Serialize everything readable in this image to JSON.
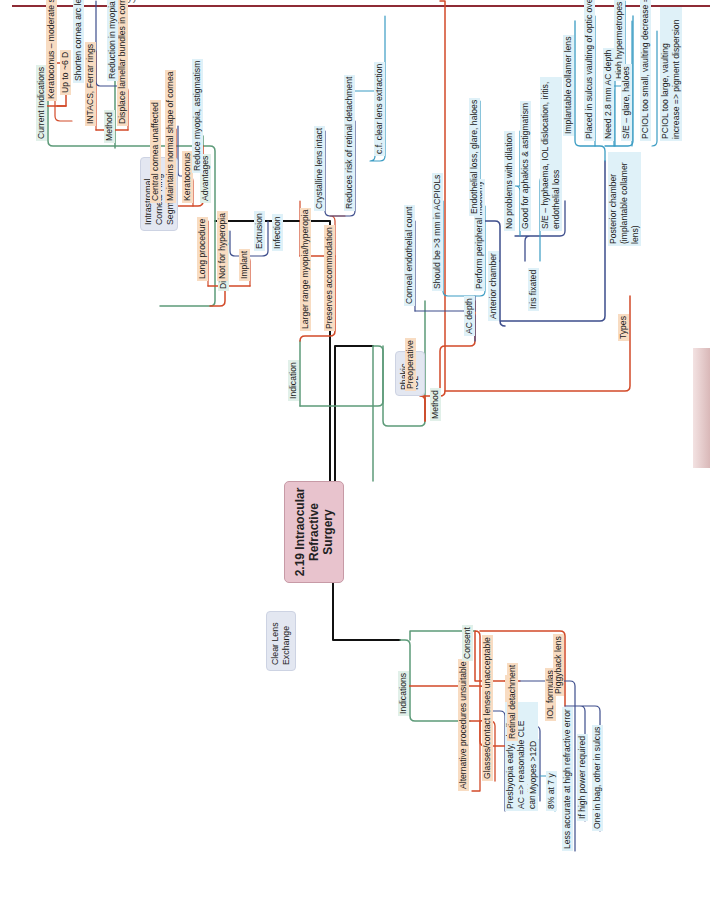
{
  "page": {
    "header_fragment": "...gy)",
    "accent_color": "#8e2b35"
  },
  "colors": {
    "level1_line": "#111111",
    "level2_line": "#5c9a78",
    "level3_line": "#d24a28",
    "level4_line": "#3d4d8c",
    "level5_line": "#3a9cc3",
    "orange_fill": "#f8dcc2",
    "blue_fill": "#dff1f8",
    "green_fill": "#e1f0e9",
    "central_fill": "#e8c3cd",
    "main_fill": "#e3e7f1"
  },
  "central": {
    "title_line1": "2.19 Intraocular",
    "title_line2": "Refractive",
    "title_line3": "Surgery"
  },
  "icrs": {
    "title": "Intrastromal Corneal Ring Segments",
    "current_indications": {
      "label": "Current Indications",
      "children": [
        "Keratoconus – moderate severity <53 D",
        "Up to ~6 D"
      ]
    },
    "method": {
      "label": "Method",
      "children": [
        "INTACS, Ferrar rings",
        "Displace lamellar bundles in cornea"
      ],
      "sub": [
        "Shorten cornea arc length",
        "Reduction in myopia"
      ]
    },
    "advantages": {
      "label": "Advantages",
      "children": [
        "Central cornea unaffected",
        "Maintains normal shape of cornea",
        "Keratoconus"
      ],
      "sub": [
        "Reduce myopia, astigmatism"
      ]
    },
    "disadvantages": {
      "label": "Disadvantages",
      "children": [
        "Long procedure",
        "Not for hyperopia",
        "Implant"
      ],
      "sub": [
        "Extrusion",
        "Infection"
      ]
    }
  },
  "phakic": {
    "title": "Phakic IOL",
    "indication": {
      "label": "Indication",
      "children": [
        "Larger range myopia/hyperopia",
        "Preserves accommodation"
      ],
      "sub": [
        "Crystalline lens intact",
        "Reduces risk of retinal detachment"
      ],
      "sub2": [
        "c.f. clear lens extraction"
      ]
    },
    "method": {
      "label": "Method",
      "preoperative": {
        "label": "Preoperative",
        "children": [
          "Corneal endothelial count",
          "AC depth"
        ],
        "sub": [
          "Should be >3 mm in ACPIOLs",
          "Perform peripheral iridotomy"
        ]
      },
      "types": {
        "label": "Types",
        "anterior": {
          "label": "Anterior chamber",
          "children": [
            "Endothelial loss, glare, haloes"
          ]
        },
        "iris": {
          "label": "Iris fixated",
          "children": [
            "No problems with dilation",
            "Good for aphakics & astigmatism",
            "S/E – hyphaema, IOL dislocation, iritis, endothelial loss"
          ]
        },
        "posterior": {
          "label": "Posterior chamber (implantable collamer lens)",
          "children": [
            "Implantable collamer lens",
            "Placed in sulcus vaulting of optic over crystalline lens",
            "Need 2.8 mm AC depth",
            "S/E – glare, haloes",
            "PCIOL too small, vaulting decrease => cataract",
            "PCIOL too large, vaulting increase => pigment dispersion"
          ],
          "sub": [
            "High hypermetropes unsuitable"
          ]
        }
      }
    }
  },
  "cle": {
    "title": "Clear Lens Exchange",
    "indications": {
      "label": "Indications",
      "children": [
        "Alternative procedures unsuitable",
        "Glasses/contact lenses unacceptable",
        "Hyperopes"
      ],
      "sub": [
        "Presbyopia early, shallow AC => reasonable CLE candidates"
      ]
    },
    "consent": {
      "label": "Consent",
      "children": [
        "Retinal detachment",
        "IOL formulas",
        "Piggyback lens"
      ],
      "retinal_sub": [
        "Myopes >12D"
      ],
      "retinal_sub2": [
        "8% at 7 y"
      ],
      "iol_sub": [
        "Less accurate at high refractive error"
      ],
      "piggy_sub": [
        "If high power required",
        "One in bag, other in sulcus"
      ]
    }
  }
}
